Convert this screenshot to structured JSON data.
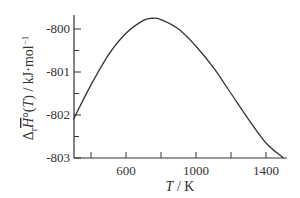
{
  "chart_data": {
    "type": "line",
    "title": "",
    "xlabel": "T / K",
    "ylabel": "Δr H°(T) / kJ·mol⁻¹",
    "xlim": [
      300,
      1540
    ],
    "ylim": [
      -803,
      -799.67
    ],
    "xticks": [
      400,
      600,
      800,
      1000,
      1200,
      1400
    ],
    "xtick_labels": [
      "600",
      "1000",
      "1400"
    ],
    "yticks": [
      -800,
      -801,
      -802,
      -803
    ],
    "ytick_labels": [
      "-800",
      "-801",
      "-802",
      "-803"
    ],
    "grid": false,
    "legend": null,
    "series": [
      {
        "name": "ΔrH°(T)",
        "x": [
          300,
          400,
          500,
          600,
          700,
          750,
          800,
          900,
          1000,
          1100,
          1200,
          1300,
          1400,
          1500
        ],
        "y": [
          -802.1,
          -801.3,
          -800.6,
          -800.1,
          -799.8,
          -799.75,
          -799.78,
          -800.0,
          -800.4,
          -800.9,
          -801.5,
          -802.1,
          -802.65,
          -803.0
        ]
      }
    ]
  },
  "labels": {
    "x_axis": "T / K",
    "y_axis_main": "Δ",
    "y_axis_sub": "r",
    "y_axis_symbol": "H",
    "y_axis_rest": "°(T) / kJ·mol",
    "y_axis_exp": "−1"
  }
}
